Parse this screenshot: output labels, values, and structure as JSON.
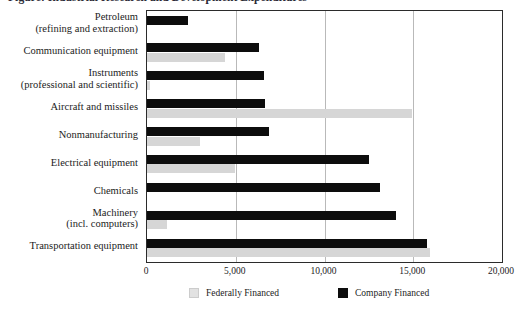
{
  "chart_data": {
    "type": "bar",
    "orientation": "horizontal",
    "title": "Figure: Industrial Research and Development Expenditures",
    "xlabel": "",
    "ylabel": "",
    "xlim": [
      0,
      20000
    ],
    "xticks": [
      "0",
      "5,000",
      "10,000",
      "15,000",
      "20,000"
    ],
    "xtick_values": [
      0,
      5000,
      10000,
      15000,
      20000
    ],
    "grid": true,
    "grid_axis": "x",
    "legend_position": "bottom",
    "categories": [
      "Petroleum (refining and extraction)",
      "Communication equipment",
      "Instruments (professional and scientific)",
      "Aircraft and missiles",
      "Nonmanufacturing",
      "Electrical equipment",
      "Chemicals",
      "Machinery (incl. computers)",
      "Transportation equipment"
    ],
    "category_lines": [
      [
        "Petroleum",
        "(refining and extraction)"
      ],
      [
        "Communication equipment",
        ""
      ],
      [
        "Instruments",
        "(professional and scientific)"
      ],
      [
        "Aircraft and missiles",
        ""
      ],
      [
        "Nonmanufacturing",
        ""
      ],
      [
        "Electrical equipment",
        ""
      ],
      [
        "Chemicals",
        ""
      ],
      [
        "Machinery",
        "(incl. computers)"
      ],
      [
        "Transportation equipment",
        ""
      ]
    ],
    "series": [
      {
        "name": "Company Financed",
        "color": "#0d0d0d",
        "values": [
          2300,
          6330,
          6600,
          6650,
          6880,
          12480,
          13140,
          14050,
          15790
        ]
      },
      {
        "name": "Federally Financed",
        "color": "#d6d6d6",
        "values": [
          0,
          4370,
          150,
          14950,
          2960,
          4930,
          0,
          1100,
          15950
        ]
      }
    ]
  },
  "legend": {
    "items": [
      {
        "label": "Federally Financed",
        "swatch": "federal"
      },
      {
        "label": "Company Financed",
        "swatch": "company"
      }
    ]
  }
}
